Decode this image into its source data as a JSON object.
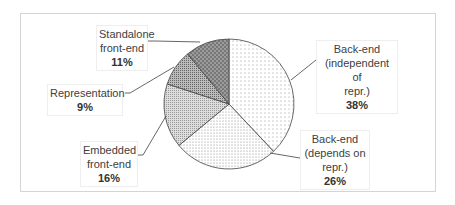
{
  "chart_data": {
    "type": "pie",
    "title": "",
    "categories": [
      "Back-end (independent of repr.)",
      "Back-end (depends on repr.)",
      "Embedded front-end",
      "Representation",
      "Standalone front-end"
    ],
    "values": [
      38,
      26,
      16,
      9,
      11
    ],
    "unit": "%",
    "start_angle": "12 o'clock, clockwise",
    "labels": [
      {
        "lines": [
          "Back-end",
          "(independent of",
          "repr.)"
        ],
        "pct": "38%"
      },
      {
        "lines": [
          "Back-end",
          "(depends on",
          "repr.)"
        ],
        "pct": "26%"
      },
      {
        "lines": [
          "Embedded",
          "front-end"
        ],
        "pct": "16%"
      },
      {
        "lines": [
          "Representation"
        ],
        "pct": "9%"
      },
      {
        "lines": [
          "Standalone",
          "front-end"
        ],
        "pct": "11%"
      }
    ],
    "legend": "none (data labels with leader lines)"
  }
}
